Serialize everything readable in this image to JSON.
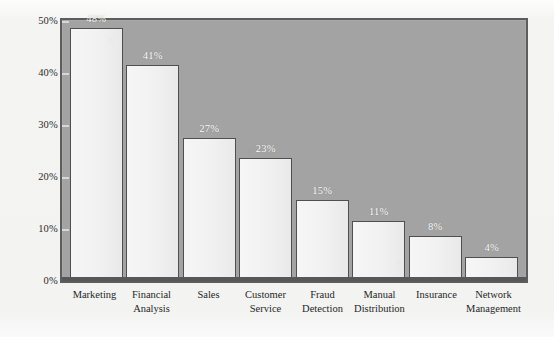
{
  "chart_data": {
    "type": "bar",
    "title": "",
    "subtitle": "",
    "xlabel": "",
    "ylabel": "",
    "ylim": [
      0,
      50
    ],
    "grid": false,
    "legend": false,
    "orientation": "vertical",
    "categories": [
      "Marketing",
      "Financial Analysis",
      "Sales",
      "Customer Service",
      "Fraud Detection",
      "Manual Distribution",
      "Insurance",
      "Network Management"
    ],
    "category_lines": [
      [
        "Marketing"
      ],
      [
        "Financial",
        "Analysis"
      ],
      [
        "Sales"
      ],
      [
        "Customer",
        "Service"
      ],
      [
        "Fraud",
        "Detection"
      ],
      [
        "Manual",
        "Distribution"
      ],
      [
        "Insurance"
      ],
      [
        "Network",
        "Management"
      ]
    ],
    "values": [
      48,
      41,
      27,
      23,
      15,
      11,
      8,
      4
    ],
    "value_labels": [
      "48%",
      "41%",
      "27%",
      "23%",
      "15%",
      "11%",
      "8%",
      "4%"
    ],
    "yticks": [
      50,
      40,
      30,
      20,
      10,
      0
    ],
    "ytick_labels": [
      "50%",
      "40%",
      "30%",
      "20%",
      "10%",
      "0%"
    ],
    "colors": {
      "plot_background": "#a3a3a3",
      "bar_fill": "#f1f1f1",
      "bar_outline": "#4f4f4f",
      "frame": "#5d5d5d",
      "value_label": "#ffffff",
      "axis_text": "#262626",
      "page_background": "#f3f3f2"
    }
  }
}
